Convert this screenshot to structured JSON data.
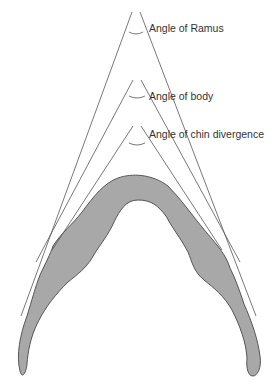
{
  "diagram": {
    "labels": {
      "ramus": "Angle of Ramus",
      "body": "Angle of body",
      "chin": "Angle of chin divergence"
    },
    "colors": {
      "bone_fill": "#a8a8a8",
      "bone_stroke": "#555555",
      "line": "#555555",
      "text": "#333333",
      "background": "#ffffff"
    },
    "angles": [
      {
        "name": "ramus",
        "apex": [
          136,
          20
        ]
      },
      {
        "name": "body",
        "apex": [
          137,
          87
        ]
      },
      {
        "name": "chin",
        "apex": [
          137,
          133
        ]
      }
    ]
  }
}
